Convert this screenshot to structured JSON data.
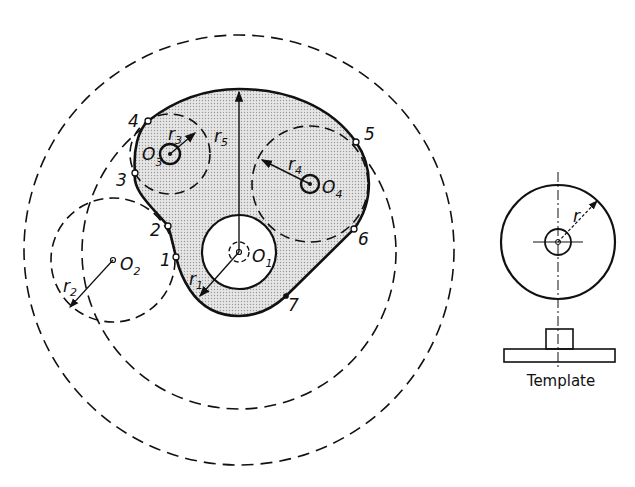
{
  "diagram": {
    "type": "cam-profile construction",
    "labels": {
      "points": [
        "1",
        "2",
        "3",
        "4",
        "5",
        "6",
        "7"
      ],
      "centers": {
        "o1": "O",
        "o1_sub": "1",
        "o2": "O",
        "o2_sub": "2",
        "o3": "O",
        "o3_sub": "3",
        "o4": "O",
        "o4_sub": "4"
      },
      "radii": {
        "r1": "r",
        "r1_sub": "1",
        "r2": "r",
        "r2_sub": "2",
        "r3": "r",
        "r3_sub": "3",
        "r4": "r",
        "r4_sub": "4",
        "r5": "r",
        "r5_sub": "5"
      },
      "template_radius": "r",
      "template_caption": "Template"
    },
    "colors": {
      "stroke": "#111111",
      "fill_cam": "#d9d9d9",
      "background": "#ffffff"
    }
  }
}
